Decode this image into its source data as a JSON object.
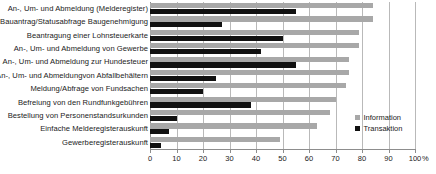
{
  "chart_data": {
    "type": "bar",
    "orientation": "horizontal",
    "title": "",
    "xlabel": "%",
    "ylabel": "",
    "xlim": [
      0,
      100
    ],
    "xticks": [
      0,
      10,
      20,
      30,
      40,
      50,
      60,
      70,
      80,
      90,
      100
    ],
    "xtick_labels": [
      "0",
      "10",
      "20",
      "30",
      "40",
      "50",
      "60",
      "70",
      "80",
      "90",
      "100"
    ],
    "axis_unit": "%",
    "grid": true,
    "grid_axis": "x",
    "legend_position": "right",
    "categories": [
      "An-, Um- und Abmeldung (Melderegister)",
      "Bauantrag/Statusabfrage Baugenehmigung",
      "Beantragung einer Lohnsteuerkarte",
      "An-, Um- und Abmeldung von Gewerbe",
      "An-, Um- und Abmeldung zur Hundesteuer",
      "An-, Um- und Abmeldungvon Abfallbehältern",
      "Meldung/Abfrage von Fundsachen",
      "Befreiung von den Rundfunkgebühren",
      "Bestellung von Personenstandsurkunden",
      "Einfache Melderegisterauskunft",
      "Gewerberegisterauskunft"
    ],
    "series": [
      {
        "name": "Information",
        "color": "#a8a8a8",
        "values": [
          84,
          84,
          79,
          79,
          75,
          75,
          74,
          70,
          68,
          63,
          49
        ]
      },
      {
        "name": "Transaktion",
        "color": "#111111",
        "values": [
          55,
          27,
          50,
          42,
          55,
          25,
          20,
          38,
          10,
          7,
          4
        ]
      }
    ]
  },
  "legend": {
    "items": [
      {
        "label": "Information"
      },
      {
        "label": "Transaktion"
      }
    ]
  },
  "colors": {
    "information": "#a8a8a8",
    "transaktion": "#111111",
    "grid": "#b9b9b9",
    "axis": "#8d8d8d",
    "text": "#1a1a1a",
    "background": "#ffffff"
  }
}
